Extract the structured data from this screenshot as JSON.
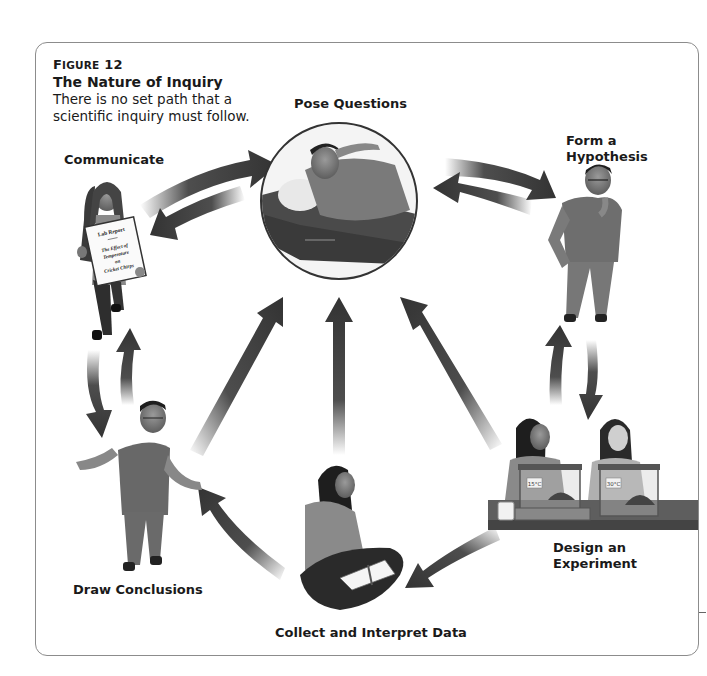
{
  "figure": {
    "number_label": "Figure 12",
    "number_prefix": "F",
    "number_smallcaps": "IGURE",
    "number": "12",
    "title": "The Nature of Inquiry",
    "description": "There is no set path that a scientific inquiry must follow."
  },
  "stages": {
    "pose_questions": "Pose Questions",
    "form_hypothesis_line1": "Form a",
    "form_hypothesis_line2": "Hypothesis",
    "design_experiment_line1": "Design an",
    "design_experiment_line2": "Experiment",
    "collect_data": "Collect and Interpret Data",
    "draw_conclusions": "Draw Conclusions",
    "communicate": "Communicate"
  },
  "props": {
    "lab_report_title": "Lab Report",
    "lab_report_line1": "The Effect of",
    "lab_report_line2": "Temperature",
    "lab_report_line3": "on",
    "lab_report_line4": "Cricket Chirps",
    "tank_left_label": "15°C",
    "tank_right_label": "30°C"
  },
  "colors": {
    "arrow": "#3a3a3a",
    "frame": "#8c8c8c",
    "text": "#1a1a1a"
  }
}
